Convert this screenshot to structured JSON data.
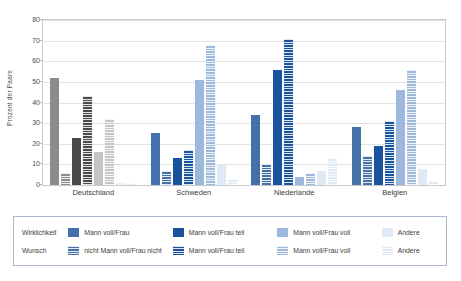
{
  "chart_data": {
    "type": "bar",
    "title": "",
    "xlabel": "",
    "ylabel": "Prozent der Paare",
    "ylim": [
      0,
      80
    ],
    "yticks": [
      0,
      10,
      20,
      30,
      40,
      50,
      60,
      70,
      80
    ],
    "grid": true,
    "legend_position": "bottom",
    "categories": [
      "Deutschland",
      "Schweden",
      "Niederlande",
      "Belgien"
    ],
    "series": [
      {
        "name": "Wirklichkeit: Mann voll/Frau",
        "row": "Wirklichkeit",
        "pattern": "solid",
        "color": "#4472a8",
        "values": [
          52,
          25,
          34,
          28
        ]
      },
      {
        "name": "Wunsch: nicht Mann voll/Frau nicht",
        "row": "Wunsch",
        "pattern": "striped",
        "color": "#4472a8",
        "values": [
          6,
          7,
          10,
          14
        ]
      },
      {
        "name": "Wirklichkeit: Mann voll/Frau teil",
        "row": "Wirklichkeit",
        "pattern": "solid",
        "color": "#19539e",
        "values": [
          23,
          13,
          56,
          19
        ]
      },
      {
        "name": "Wunsch: Mann voll/Frau teil",
        "row": "Wunsch",
        "pattern": "striped",
        "color": "#19539e",
        "values": [
          43,
          17,
          71,
          31
        ]
      },
      {
        "name": "Wirklichkeit: Mann voll/Frau voll",
        "row": "Wirklichkeit",
        "pattern": "solid",
        "color": "#9cb8dc",
        "values": [
          16,
          51,
          4,
          46
        ]
      },
      {
        "name": "Wunsch: Mann voll/Frau voll",
        "row": "Wunsch",
        "pattern": "striped",
        "color": "#9cb8dc",
        "values": [
          32,
          68,
          6,
          56
        ]
      },
      {
        "name": "Wirklichkeit: Andere",
        "row": "Wirklichkeit",
        "pattern": "solid",
        "color": "#e0eaf5",
        "values": [
          1,
          10,
          7,
          8
        ]
      },
      {
        "name": "Wunsch: Andere",
        "row": "Wunsch",
        "pattern": "striped",
        "color": "#e0eaf5",
        "values": [
          1,
          3,
          13,
          2
        ]
      }
    ],
    "series_colors_deutschland": [
      "#8c8c8c",
      "#8c8c8c",
      "#4a4a4a",
      "#4a4a4a",
      "#c4c4c4",
      "#c4c4c4",
      "#f0f0f0",
      "#f0f0f0"
    ]
  },
  "axis": {
    "ylabel": "Prozent der Paare",
    "ticks": [
      "80",
      "70",
      "60",
      "50",
      "40",
      "30",
      "20",
      "10",
      "0"
    ]
  },
  "xlabels": [
    "Deutschland",
    "Schweden",
    "Niederlande",
    "Belgien"
  ],
  "legend": {
    "rows": [
      {
        "label": "Wirklichkeit",
        "entries": [
          {
            "text": "Mann voll/Frau",
            "color": "#4472a8",
            "pattern": "solid"
          },
          {
            "text": "Mann voll/Frau teil",
            "color": "#19539e",
            "pattern": "solid"
          },
          {
            "text": "Mann voll/Frau voll",
            "color": "#9cb8dc",
            "pattern": "solid"
          },
          {
            "text": "Andere",
            "color": "#e0eaf5",
            "pattern": "solid"
          }
        ]
      },
      {
        "label": "Wunsch",
        "entries": [
          {
            "text": "nicht Mann voll/Frau nicht",
            "color": "#4472a8",
            "pattern": "striped"
          },
          {
            "text": "Mann voll/Frau teil",
            "color": "#19539e",
            "pattern": "striped"
          },
          {
            "text": "Mann voll/Frau voll",
            "color": "#9cb8dc",
            "pattern": "striped"
          },
          {
            "text": "Andere",
            "color": "#e0eaf5",
            "pattern": "striped"
          }
        ]
      }
    ]
  }
}
